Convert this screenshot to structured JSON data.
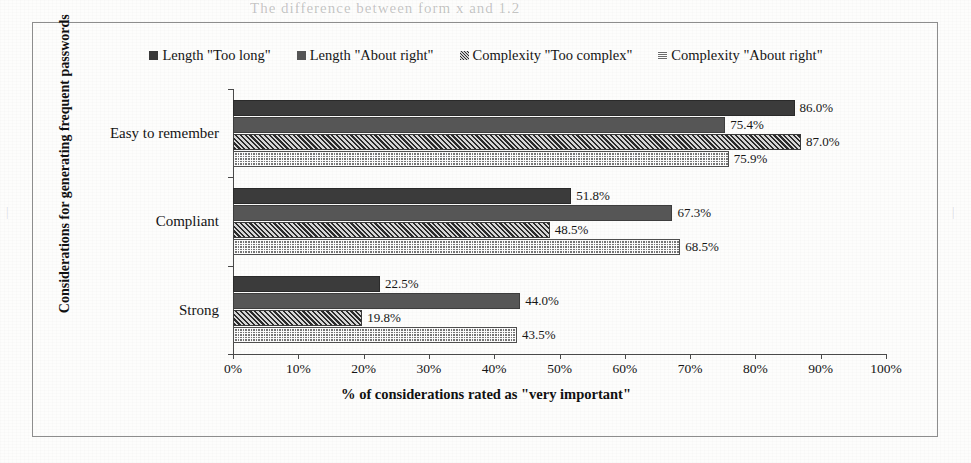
{
  "page": {
    "ghost_top_text": "The difference between form x and 1.2",
    "ghost_side_text": "|"
  },
  "chart_data": {
    "type": "bar",
    "orientation": "horizontal",
    "title": "",
    "xlabel": "% of considerations rated as \"very important\"",
    "ylabel": "Considerations for generating frequent passwords",
    "categories": [
      "Easy to remember",
      "Compliant",
      "Strong"
    ],
    "xlim": [
      0,
      100
    ],
    "xticks": [
      0,
      10,
      20,
      30,
      40,
      50,
      60,
      70,
      80,
      90,
      100
    ],
    "xtick_labels": [
      "0%",
      "10%",
      "20%",
      "30%",
      "40%",
      "50%",
      "60%",
      "70%",
      "80%",
      "90%",
      "100%"
    ],
    "grid": false,
    "legend_position": "top",
    "series": [
      {
        "name": "Length \"Too long\"",
        "pattern": "solid-dark",
        "color": "#3b3b3b",
        "values": [
          86.0,
          51.8,
          22.5
        ],
        "labels": [
          "86.0%",
          "51.8%",
          "22.5%"
        ]
      },
      {
        "name": "Length \"About right\"",
        "pattern": "solid-medium",
        "color": "#565656",
        "values": [
          75.4,
          67.3,
          44.0
        ],
        "labels": [
          "75.4%",
          "67.3%",
          "44.0%"
        ]
      },
      {
        "name": "Complexity \"Too complex\"",
        "pattern": "diagonal-hatch",
        "color": "#2b2b2b",
        "values": [
          87.0,
          48.5,
          19.8
        ],
        "labels": [
          "87.0%",
          "48.5%",
          "19.8%"
        ]
      },
      {
        "name": "Complexity \"About right\"",
        "pattern": "dotted-grid",
        "color": "#767676",
        "values": [
          75.9,
          68.5,
          43.5
        ],
        "labels": [
          "75.9%",
          "68.5%",
          "43.5%"
        ]
      }
    ]
  }
}
